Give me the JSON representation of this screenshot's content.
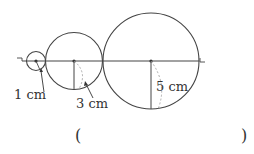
{
  "diagram": {
    "type": "tangent-circles-on-line",
    "line": {
      "start_label": "ㄱ",
      "end_label": "ㄴ"
    },
    "circles": [
      {
        "name": "small",
        "radius_label": "1 cm"
      },
      {
        "name": "medium",
        "radius_label": "3 cm"
      },
      {
        "name": "large",
        "radius_label": "5 cm"
      }
    ],
    "colors": {
      "stroke": "#444444",
      "dashed": "#999999"
    }
  },
  "answer": {
    "open_paren": "(",
    "close_paren": ")",
    "value": ""
  }
}
